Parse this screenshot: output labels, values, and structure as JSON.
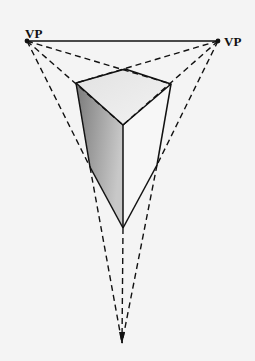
{
  "diagram": {
    "title": "",
    "type": "three-point perspective",
    "labels": {
      "left_vp": "VP",
      "right_vp": "VP"
    },
    "colors": {
      "background": "#f4f4f4",
      "line": "#111111",
      "left_face_dark": "#7a7a7a",
      "left_face_light": "#c4c4c4",
      "top_face": "#ececec",
      "right_face": "#f7f7f7"
    },
    "points": {
      "vp_left": [
        27,
        41
      ],
      "vp_right": [
        218,
        41
      ],
      "vp_bottom": [
        122,
        343
      ],
      "top_back": [
        125,
        69
      ],
      "top_left": [
        76,
        83
      ],
      "top_right": [
        171,
        84
      ],
      "top_front": [
        123,
        125
      ],
      "bottom_left": [
        90,
        167
      ],
      "bottom_right": [
        157,
        165
      ],
      "bottom_front": [
        123,
        228
      ]
    }
  }
}
